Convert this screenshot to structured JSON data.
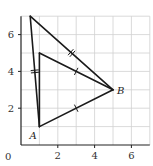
{
  "diagram": {
    "type": "coordinate-geometry",
    "origin_label": "0",
    "x_ticks": [
      {
        "value": 2,
        "label": "2"
      },
      {
        "value": 4,
        "label": "4"
      },
      {
        "value": 6,
        "label": "6"
      }
    ],
    "y_ticks": [
      {
        "value": 2,
        "label": "2"
      },
      {
        "value": 4,
        "label": "4"
      },
      {
        "value": 6,
        "label": "6"
      }
    ],
    "grid": {
      "x_min": 0,
      "x_max": 7,
      "y_min": 0,
      "y_max": 7,
      "step": 1
    },
    "points": [
      {
        "name": "A",
        "x": 1,
        "y": 1,
        "label": "A"
      },
      {
        "name": "B",
        "x": 5,
        "y": 3,
        "label": "B"
      },
      {
        "name": "P",
        "x": 1,
        "y": 5,
        "label": ""
      },
      {
        "name": "Q",
        "x": 0.5,
        "y": 7,
        "label": ""
      }
    ],
    "segments": [
      {
        "from": "A",
        "to": "B",
        "ticks": 1
      },
      {
        "from": "P",
        "to": "B",
        "ticks": 1
      },
      {
        "from": "A",
        "to": "P",
        "ticks": 0
      },
      {
        "from": "Q",
        "to": "B",
        "ticks": 2
      },
      {
        "from": "A",
        "to": "Q",
        "ticks": 2
      }
    ],
    "colors": {
      "line": "#1a1a1a",
      "grid": "#d0d0d0",
      "axis": "#222222"
    }
  }
}
